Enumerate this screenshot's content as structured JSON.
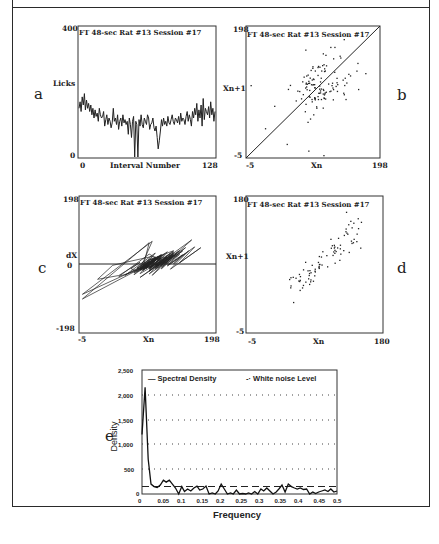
{
  "figure": {
    "panels": [
      {
        "letter": "a",
        "title": "FT 48-sec   Rat #13   Session #17",
        "ylabel": "Licks",
        "xlabel": "Interval Number",
        "xmin": "0",
        "xmax": "128",
        "ymin": "0",
        "ymax": "400"
      },
      {
        "letter": "b",
        "title": "FT 48-sec   Rat #13  Session #17",
        "ylabel": "Xn+1",
        "xlabel": "Xn",
        "xmin": "-5",
        "xmax": "198",
        "ymin": "-5",
        "ymax": "198"
      },
      {
        "letter": "c",
        "title": "FT 48-sec   Rat #13   Session #17",
        "ylabel": "dX",
        "yzero": "0",
        "xlabel": "Xn",
        "xmin": "-5",
        "xmax": "198",
        "ymin": "-198",
        "ymax": "198"
      },
      {
        "letter": "d",
        "title": "FT 48-sec   Rat #13   Session #17",
        "ylabel": "Xn+1",
        "xlabel": "Xn",
        "xmin": "-5",
        "xmax": "180",
        "ymin": "-5",
        "ymax": "180"
      },
      {
        "letter": "e",
        "ylabel": "Density",
        "xlabel": "Frequency",
        "legend": [
          "Spectral Density",
          "White noise Level"
        ],
        "yticks": [
          "0",
          "500",
          "1,000",
          "1,500",
          "2,000",
          "2,500"
        ],
        "xticks": [
          "0",
          "0.05",
          "0.1",
          "0.15",
          "0.2",
          "0.25",
          "0.3",
          "0.35",
          "0.4",
          "0.45",
          "0.5"
        ]
      }
    ]
  },
  "chart_data": [
    {
      "type": "line",
      "panel": "a",
      "title": "FT 48-sec Rat #13 Session #17",
      "xlabel": "Interval Number",
      "ylabel": "Licks",
      "xlim": [
        0,
        128
      ],
      "ylim": [
        0,
        400
      ],
      "y": [
        150,
        170,
        140,
        185,
        160,
        195,
        145,
        175,
        150,
        165,
        140,
        160,
        130,
        150,
        120,
        145,
        125,
        135,
        110,
        150,
        130,
        120,
        125,
        140,
        95,
        115,
        130,
        100,
        120,
        110,
        90,
        105,
        150,
        110,
        120,
        100,
        130,
        85,
        110,
        120,
        95,
        130,
        105,
        115,
        100,
        110,
        70,
        120,
        100,
        60,
        110,
        125,
        0,
        110,
        100,
        0,
        115,
        95,
        130,
        100,
        90,
        120,
        110,
        100,
        130,
        120,
        85,
        100,
        105,
        120,
        90,
        80,
        95,
        60,
        25,
        50,
        80,
        115,
        95,
        120,
        100,
        110,
        95,
        125,
        105,
        100,
        115,
        130,
        110,
        100,
        120,
        115,
        105,
        125,
        100,
        135,
        110,
        120,
        115,
        100,
        125,
        140,
        110,
        130,
        115,
        95,
        140,
        120,
        150,
        130,
        165,
        110,
        145,
        120,
        160,
        95,
        180,
        115,
        150,
        140,
        130,
        155,
        120,
        170,
        130,
        150,
        110,
        140
      ]
    },
    {
      "type": "scatter",
      "panel": "b",
      "title": "FT 48-sec Rat #13 Session #17",
      "xlabel": "Xn",
      "ylabel": "Xn+1",
      "xlim": [
        -5,
        198
      ],
      "ylim": [
        -5,
        198
      ],
      "note": "return map with identity diagonal; ~127 points clustered around (110,110)"
    },
    {
      "type": "line",
      "panel": "c",
      "title": "FT 48-sec Rat #13 Session #17",
      "xlabel": "Xn",
      "ylabel": "dX",
      "xlim": [
        -5,
        198
      ],
      "ylim": [
        -198,
        198
      ],
      "note": "phase plot of dX vs Xn, horizontal zero line"
    },
    {
      "type": "scatter",
      "panel": "d",
      "title": "FT 48-sec Rat #13 Session #17",
      "xlabel": "Xn",
      "ylabel": "Xn+1",
      "xlim": [
        -5,
        180
      ],
      "ylim": [
        -5,
        180
      ]
    },
    {
      "type": "line",
      "panel": "e",
      "xlabel": "Frequency",
      "ylabel": "Density",
      "xlim": [
        0,
        0.5
      ],
      "ylim": [
        0,
        2500
      ],
      "grid": "dotted horizontal",
      "legend_position": "top",
      "series": [
        {
          "name": "Spectral Density",
          "x": [
            0,
            0.008,
            0.016,
            0.023,
            0.031,
            0.039,
            0.047,
            0.055,
            0.062,
            0.07,
            0.078,
            0.086,
            0.094,
            0.102,
            0.109,
            0.117,
            0.125,
            0.133,
            0.141,
            0.148,
            0.156,
            0.164,
            0.172,
            0.18,
            0.188,
            0.195,
            0.203,
            0.211,
            0.219,
            0.227,
            0.234,
            0.242,
            0.25,
            0.258,
            0.266,
            0.273,
            0.281,
            0.289,
            0.297,
            0.305,
            0.312,
            0.32,
            0.328,
            0.336,
            0.344,
            0.352,
            0.359,
            0.367,
            0.375,
            0.383,
            0.391,
            0.398,
            0.406,
            0.414,
            0.422,
            0.43,
            0.438,
            0.445,
            0.453,
            0.461,
            0.469,
            0.477,
            0.484,
            0.492,
            0.5
          ],
          "y": [
            1200,
            2150,
            700,
            200,
            150,
            130,
            180,
            280,
            240,
            280,
            200,
            120,
            0,
            150,
            50,
            100,
            60,
            120,
            160,
            80,
            100,
            160,
            0,
            20,
            0,
            60,
            200,
            100,
            0,
            20,
            0,
            80,
            0,
            10,
            0,
            20,
            0,
            50,
            0,
            100,
            60,
            120,
            60,
            0,
            40,
            110,
            180,
            40,
            200,
            150,
            120,
            100,
            120,
            90,
            100,
            0,
            40,
            10,
            40,
            60,
            80,
            50,
            100,
            40,
            60
          ]
        },
        {
          "name": "White noise Level",
          "x": [
            0,
            0.5
          ],
          "y": [
            150,
            150
          ]
        }
      ]
    }
  ]
}
